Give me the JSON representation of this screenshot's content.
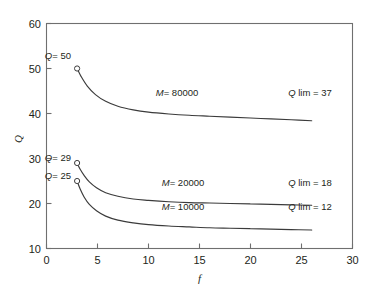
{
  "chart_data": {
    "type": "line",
    "title": "",
    "xlabel": "f",
    "ylabel": "Q",
    "xlim": [
      0,
      30
    ],
    "ylim": [
      10,
      60
    ],
    "xticks": [
      0,
      5,
      10,
      15,
      20,
      25,
      30
    ],
    "yticks": [
      10,
      20,
      30,
      40,
      50,
      60
    ],
    "grid": false,
    "legend_position": "inline-annotations",
    "series": [
      {
        "name": "M = 80000",
        "label": "M= 80000",
        "start_label": "Q= 50",
        "limit_label": "Q lim = 37",
        "start_point": [
          3,
          50
        ],
        "limit_value": 37,
        "x": [
          3,
          3.4,
          4,
          4.8,
          5.8,
          7,
          8.5,
          10,
          12,
          14,
          16,
          18,
          20,
          22,
          24,
          26
        ],
        "y": [
          50,
          48.2,
          46.1,
          44.2,
          42.7,
          41.6,
          40.8,
          40.3,
          39.9,
          39.6,
          39.4,
          39.2,
          39.0,
          38.8,
          38.6,
          38.4
        ]
      },
      {
        "name": "M = 20000",
        "label": "M= 20000",
        "start_label": "Q= 29",
        "limit_label": "Q lim = 18",
        "start_point": [
          3,
          29
        ],
        "limit_value": 18,
        "x": [
          3,
          3.3,
          3.7,
          4.2,
          4.9,
          5.8,
          7,
          8.5,
          10,
          12,
          14,
          16,
          18,
          20,
          22,
          24,
          26
        ],
        "y": [
          29,
          27.6,
          26.2,
          24.8,
          23.5,
          22.4,
          21.6,
          21.0,
          20.7,
          20.4,
          20.2,
          20.1,
          20.0,
          19.9,
          19.8,
          19.7,
          19.6
        ]
      },
      {
        "name": "M = 10000",
        "label": "M= 10000",
        "start_label": "Q= 25",
        "limit_label": "Q lim = 12",
        "start_point": [
          3,
          25
        ],
        "limit_value": 12,
        "x": [
          3,
          3.3,
          3.7,
          4.2,
          4.9,
          5.8,
          7,
          8.5,
          10,
          12,
          14,
          16,
          18,
          20,
          22,
          24,
          26
        ],
        "y": [
          25,
          23.2,
          21.4,
          19.8,
          18.4,
          17.2,
          16.3,
          15.7,
          15.3,
          15.0,
          14.8,
          14.6,
          14.5,
          14.4,
          14.3,
          14.2,
          14.1
        ]
      }
    ],
    "annotations": [
      {
        "text": "Q= 50",
        "italic_head": "Q",
        "rest": "= 50",
        "x": 3,
        "y": 52.6,
        "anchor": "end-left"
      },
      {
        "text": "Q= 29",
        "italic_head": "Q",
        "rest": "= 29",
        "x": 3,
        "y": 30.6,
        "anchor": "end-left"
      },
      {
        "text": "Q= 25",
        "italic_head": "Q",
        "rest": "= 25",
        "x": 3,
        "y": 26.6,
        "anchor": "end-left"
      },
      {
        "text": "M= 80000",
        "italic_head": "M",
        "rest": "= 80000",
        "x": 12.8,
        "y": 42.3,
        "anchor": "middle"
      },
      {
        "text": "M= 20000",
        "italic_head": "M",
        "rest": "= 20000",
        "x": 13.4,
        "y": 22.4,
        "anchor": "middle"
      },
      {
        "text": "M= 10000",
        "italic_head": "M",
        "rest": "= 10000",
        "x": 13.4,
        "y": 17.0,
        "anchor": "middle"
      },
      {
        "text": "Q lim = 37",
        "italic_head": "Q",
        "rest": " lim = 37",
        "x": 25.8,
        "y": 42.3,
        "anchor": "middle"
      },
      {
        "text": "Q lim = 18",
        "italic_head": "Q",
        "rest": " lim = 18",
        "x": 25.8,
        "y": 22.4,
        "anchor": "middle"
      },
      {
        "text": "Q lim = 12",
        "italic_head": "Q",
        "rest": " lim = 12",
        "x": 25.8,
        "y": 17.0,
        "anchor": "middle"
      }
    ],
    "colors": {
      "curve": "#3b3b3b",
      "axis": "#6f6f6f",
      "text": "#231f20",
      "background": "#ffffff"
    }
  },
  "axis": {
    "x_tick_labels": [
      "0",
      "5",
      "10",
      "15",
      "20",
      "25",
      "30"
    ],
    "y_tick_labels": [
      "10",
      "20",
      "30",
      "40",
      "50",
      "60"
    ],
    "x_title": "f",
    "y_title": "Q"
  },
  "labels": {
    "q50": "Q",
    "q50_rest": "= 50",
    "q29": "Q",
    "q29_rest": "= 29",
    "q25": "Q",
    "q25_rest": "= 25",
    "m80": "M",
    "m80_rest": "= 80000",
    "m20": "M",
    "m20_rest": "= 20000",
    "m10": "M",
    "m10_rest": "= 10000",
    "qlim37": "Q",
    "qlim37_rest": " lim = 37",
    "qlim18": "Q",
    "qlim18_rest": " lim = 18",
    "qlim12": "Q",
    "qlim12_rest": " lim = 12"
  }
}
